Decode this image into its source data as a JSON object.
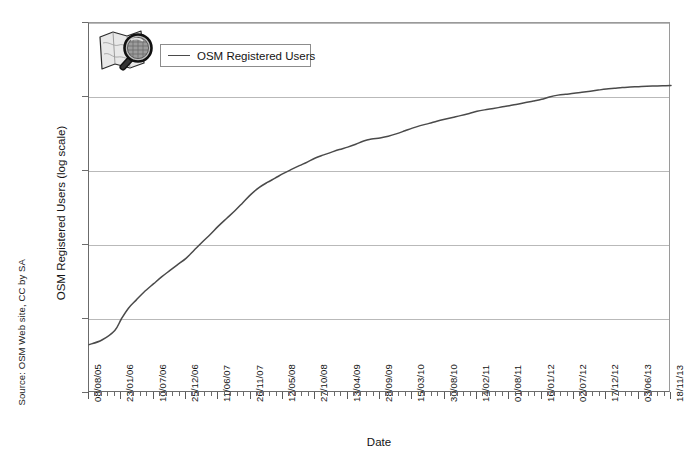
{
  "figure": {
    "source_note": "Source: OSM Web site, CC by SA"
  },
  "legend": {
    "entries": [
      {
        "label": "OSM Registered Users",
        "color": "#4a4a4a"
      }
    ]
  },
  "icons": {
    "map_magnifier": "map-magnifier-icon"
  },
  "chart_data": {
    "type": "line",
    "title": "",
    "xlabel": "Date",
    "ylabel": "OSM Registered Users (log scale)",
    "yscale": "log",
    "ylim": [
      100,
      10000000
    ],
    "ytick_labels": [
      "10,000,000",
      "1,000,000",
      "100,000",
      "10,000",
      "1,000",
      "100"
    ],
    "ytick_values": [
      10000000,
      1000000,
      100000,
      10000,
      1000,
      100
    ],
    "grid": true,
    "legend_position": "top-left",
    "xtick_labels": [
      "08/08/05",
      "23/01/06",
      "10/07/06",
      "25/12/06",
      "11/06/07",
      "26/11/07",
      "12/05/08",
      "27/10/08",
      "13/04/09",
      "28/09/09",
      "15/03/10",
      "30/08/10",
      "14/02/11",
      "01/08/11",
      "16/01/12",
      "02/07/12",
      "17/12/12",
      "03/06/13",
      "18/11/13"
    ],
    "xtick_minor_per_major": 5,
    "series": [
      {
        "name": "OSM Registered Users",
        "color": "#4a4a4a",
        "x": [
          "08/08/05",
          "14/10/05",
          "20/12/05",
          "23/01/06",
          "01/03/06",
          "10/04/06",
          "20/05/06",
          "10/07/06",
          "20/08/06",
          "01/10/06",
          "10/11/06",
          "25/12/06",
          "05/02/07",
          "20/03/07",
          "01/05/07",
          "11/06/07",
          "25/07/07",
          "05/09/07",
          "15/10/07",
          "26/11/07",
          "10/01/08",
          "20/02/08",
          "01/04/08",
          "12/05/08",
          "25/06/08",
          "05/08/08",
          "15/09/08",
          "27/10/08",
          "10/12/08",
          "20/01/09",
          "01/03/09",
          "13/04/09",
          "25/05/09",
          "05/07/09",
          "15/08/09",
          "28/09/09",
          "10/11/09",
          "25/12/09",
          "05/02/10",
          "15/03/10",
          "25/04/10",
          "10/06/10",
          "20/07/10",
          "30/08/10",
          "10/10/10",
          "20/11/10",
          "05/01/11",
          "14/02/11",
          "25/03/11",
          "10/05/11",
          "20/06/11",
          "01/08/11",
          "12/09/11",
          "25/10/11",
          "05/12/11",
          "16/01/12",
          "25/02/12",
          "10/04/12",
          "20/05/12",
          "02/07/12",
          "12/08/12",
          "25/09/12",
          "05/11/12",
          "17/12/12",
          "28/01/13",
          "10/03/13",
          "20/04/13",
          "03/06/13",
          "15/07/13",
          "25/08/13",
          "05/10/13",
          "18/11/13"
        ],
        "y": [
          450,
          520,
          700,
          1000,
          1400,
          1800,
          2300,
          3000,
          3700,
          4500,
          5400,
          6600,
          8500,
          11000,
          14000,
          18000,
          23000,
          29000,
          37000,
          48000,
          60000,
          70000,
          80000,
          92000,
          105000,
          118000,
          132000,
          150000,
          165000,
          180000,
          195000,
          210000,
          230000,
          255000,
          270000,
          280000,
          295000,
          320000,
          350000,
          380000,
          410000,
          440000,
          470000,
          500000,
          530000,
          560000,
          600000,
          640000,
          670000,
          700000,
          730000,
          760000,
          800000,
          840000,
          880000,
          930000,
          1000000,
          1060000,
          1090000,
          1120000,
          1160000,
          1200000,
          1240000,
          1280000,
          1310000,
          1340000,
          1360000,
          1380000,
          1400000,
          1410000,
          1420000,
          1430000
        ]
      }
    ]
  }
}
